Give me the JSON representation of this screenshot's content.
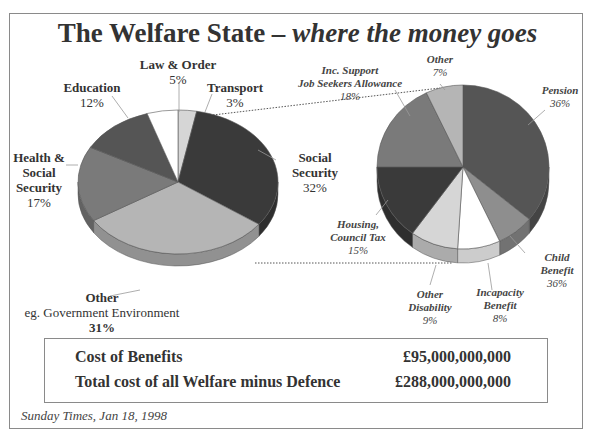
{
  "title": {
    "main": "The Welfare State – ",
    "sub": "where the money goes"
  },
  "left_pie": {
    "labels": {
      "law_order": {
        "name": "Law & Order",
        "pct": "5%"
      },
      "transport": {
        "name": "Transport",
        "pct": "3%"
      },
      "education": {
        "name": "Education",
        "pct": "12%"
      },
      "health": {
        "name1": "Health &",
        "name2": "Social",
        "name3": "Security",
        "pct": "17%"
      },
      "social_security": {
        "name1": "Social",
        "name2": "Security",
        "pct": "32%"
      },
      "other": {
        "name": "Other",
        "detail": "eg. Government Environment",
        "pct": "31%"
      }
    }
  },
  "right_pie": {
    "labels": {
      "other": {
        "name": "Other",
        "pct": "7%"
      },
      "inc_support": {
        "name1": "Inc. Support",
        "name2": "Job Seekers Allowance",
        "pct": "18%"
      },
      "pension": {
        "name": "Pension",
        "pct": "36%"
      },
      "housing": {
        "name1": "Housing,",
        "name2": "Council Tax",
        "pct": "15%"
      },
      "child_benefit": {
        "name1": "Child",
        "name2": "Benefit",
        "pct": "36%"
      },
      "other_disability": {
        "name1": "Other",
        "name2": "Disability",
        "pct": "9%"
      },
      "incapacity": {
        "name1": "Incapacity",
        "name2": "Benefit",
        "pct": "8%"
      }
    }
  },
  "summary": {
    "rows": [
      {
        "label": "Cost of Benefits",
        "value": "£95,000,000,000"
      },
      {
        "label": "Total cost of all Welfare minus Defence",
        "value": "£288,000,000,000"
      }
    ]
  },
  "source": "Sunday Times, Jan 18, 1998",
  "colors": {
    "dark": "#3a3a3a",
    "mid_dark": "#555555",
    "mid": "#7a7a7a",
    "light_mid": "#8e8e8e",
    "light": "#b5b5b5",
    "very_light": "#d6d6d6",
    "white": "#ffffff"
  },
  "chart_data": [
    {
      "type": "pie",
      "title": "The Welfare State – where the money goes",
      "categories": [
        "Transport",
        "Social Security",
        "Other (eg. Government Environment)",
        "Health & Social Security",
        "Education",
        "Law & Order"
      ],
      "values": [
        3,
        32,
        31,
        17,
        12,
        5
      ],
      "unit": "%"
    },
    {
      "type": "pie",
      "title": "Social Security breakdown",
      "categories": [
        "Pension",
        "Child Benefit",
        "Incapacity Benefit",
        "Other Disability",
        "Housing, Council Tax",
        "Inc. Support / Job Seekers Allowance",
        "Other"
      ],
      "values": [
        36,
        7,
        8,
        9,
        15,
        18,
        7
      ],
      "labels_as_printed": [
        "36%",
        "36%",
        "8%",
        "9%",
        "15%",
        "18%",
        "7%"
      ],
      "unit": "%"
    }
  ]
}
